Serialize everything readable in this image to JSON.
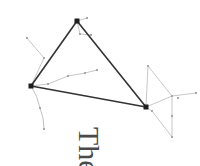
{
  "figure": {
    "type": "network-scatter-diagram",
    "background_color": "#ffffff",
    "width": 200,
    "height": 166,
    "primary_color": "#2b2b2b",
    "faint_color": "#b9b9b9",
    "faint_color_light": "#d4d4d4",
    "caption_color": "#4a4a4a"
  },
  "caption": {
    "text": "The",
    "rotation_degrees": 90
  },
  "chart_data": {
    "type": "scatter",
    "title": "",
    "xlabel": "",
    "ylabel": "",
    "xlim": [
      0,
      200
    ],
    "ylim": [
      0,
      166
    ],
    "grid": false,
    "legend": false,
    "series": [
      {
        "name": "primary-nodes",
        "marker": "square",
        "color": "#1e1e1e",
        "size": 5,
        "points": [
          {
            "id": "top",
            "x": 77,
            "y": 21
          },
          {
            "id": "left",
            "x": 31,
            "y": 86
          },
          {
            "id": "right",
            "x": 146,
            "y": 107
          }
        ]
      },
      {
        "name": "faint-nodes",
        "marker": "square",
        "color": "#a8a8a8",
        "size": 2,
        "points": [
          {
            "id": "f1",
            "x": 27,
            "y": 38
          },
          {
            "id": "f2",
            "x": 44,
            "y": 58
          },
          {
            "id": "f3",
            "x": 87,
            "y": 18
          },
          {
            "id": "f4",
            "x": 80,
            "y": 34
          },
          {
            "id": "f5",
            "x": 91,
            "y": 35
          },
          {
            "id": "f6",
            "x": 48,
            "y": 84
          },
          {
            "id": "f7",
            "x": 68,
            "y": 76
          },
          {
            "id": "f8",
            "x": 85,
            "y": 73
          },
          {
            "id": "f9",
            "x": 97,
            "y": 70
          },
          {
            "id": "f10",
            "x": 40,
            "y": 108
          },
          {
            "id": "f11",
            "x": 44,
            "y": 129
          },
          {
            "id": "f12",
            "x": 148,
            "y": 66
          },
          {
            "id": "f13",
            "x": 172,
            "y": 96
          },
          {
            "id": "f14",
            "x": 196,
            "y": 93
          },
          {
            "id": "f15",
            "x": 152,
            "y": 111
          },
          {
            "id": "f16",
            "x": 172,
            "y": 116
          },
          {
            "id": "f17",
            "x": 172,
            "y": 137
          },
          {
            "id": "f18",
            "x": 178,
            "y": 98
          }
        ]
      }
    ],
    "edges": [
      {
        "from": "top",
        "to": "left",
        "weight": "heavy"
      },
      {
        "from": "top",
        "to": "right",
        "weight": "heavy"
      },
      {
        "from": "left",
        "to": "right",
        "weight": "heavy"
      },
      {
        "from": "f1",
        "to": "f2",
        "weight": "faint"
      },
      {
        "from": "f2",
        "to": "left",
        "weight": "faint"
      },
      {
        "from": "top",
        "to": "f3",
        "weight": "faint"
      },
      {
        "from": "top",
        "to": "f4",
        "weight": "faint"
      },
      {
        "from": "f4",
        "to": "f5",
        "weight": "faint"
      },
      {
        "from": "left",
        "to": "f6",
        "weight": "faint"
      },
      {
        "from": "f6",
        "to": "f7",
        "weight": "faint"
      },
      {
        "from": "f7",
        "to": "f8",
        "weight": "faint"
      },
      {
        "from": "f8",
        "to": "f9",
        "weight": "faint"
      },
      {
        "from": "left",
        "to": "f10",
        "weight": "faint-curve"
      },
      {
        "from": "f10",
        "to": "f11",
        "weight": "faint-curve"
      },
      {
        "from": "right",
        "to": "f12",
        "weight": "faint"
      },
      {
        "from": "f12",
        "to": "f13",
        "weight": "faint"
      },
      {
        "from": "right",
        "to": "f13",
        "weight": "faint"
      },
      {
        "from": "f13",
        "to": "f14",
        "weight": "faint"
      },
      {
        "from": "right",
        "to": "f15",
        "weight": "faint"
      },
      {
        "from": "f15",
        "to": "f17",
        "weight": "faint"
      },
      {
        "from": "f13",
        "to": "f16",
        "weight": "faint"
      },
      {
        "from": "f16",
        "to": "f17",
        "weight": "faint"
      }
    ]
  }
}
